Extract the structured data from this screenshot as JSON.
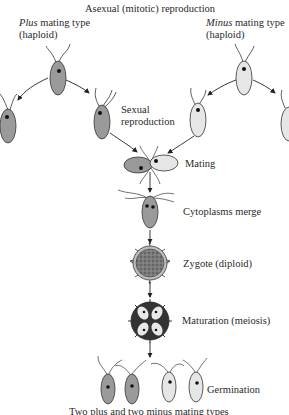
{
  "diagram": {
    "title": "Asexual (mitotic) reproduction",
    "plus_label": {
      "italic": "Plus",
      "rest": " mating type",
      "line2": "(haploid)"
    },
    "minus_label": {
      "italic": "Minus",
      "rest": " mating type",
      "line2": "(haploid)"
    },
    "sexual_label": {
      "line1": "Sexual",
      "line2": "reproduction"
    },
    "steps": [
      {
        "id": "mating",
        "label": "Mating"
      },
      {
        "id": "cytoplasms-merge",
        "label": "Cytoplasms merge"
      },
      {
        "id": "zygote",
        "label": "Zygote (diploid)"
      },
      {
        "id": "maturation",
        "label": "Maturation (meiosis)"
      },
      {
        "id": "germination",
        "label": "Germination"
      }
    ],
    "caption": "Two plus and two minus mating types",
    "colors": {
      "plus_cell": "#9a9a9a",
      "minus_cell": "#e6e6e6",
      "outline": "#333333",
      "zygote": "#6e6e6e"
    }
  }
}
